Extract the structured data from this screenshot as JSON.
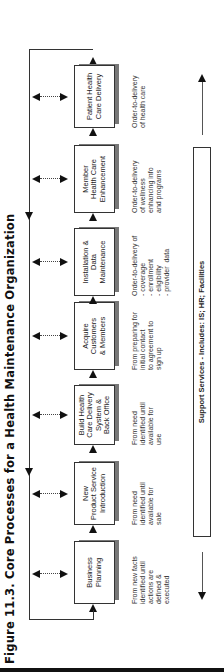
{
  "figure": {
    "title": "Figure 11.3.  Core Processes for a Health Maintenance Organization"
  },
  "processes": [
    {
      "name": "Business Planning",
      "lines": [
        "Business",
        "Planning"
      ],
      "description": "From new facts\nidentified until\nactions are\ndefined &\nexecuted"
    },
    {
      "name": "New Product Service Introduction",
      "lines": [
        "New",
        "Product Service",
        "Introduction"
      ],
      "description": "From need\nidentified until\navailable for\nsale"
    },
    {
      "name": "Build Health Care Delivery System & Back Office",
      "lines": [
        "Build Health",
        "Care Delivery",
        "System &",
        "Back Office"
      ],
      "description": "From need\nidentified until\navailable for\nuse"
    },
    {
      "name": "Acquire Customers & Members",
      "lines": [
        "Acquire",
        "Customers",
        "& Members"
      ],
      "description": "From preparing for\ninitial contact\nto agreement to\nsign up"
    },
    {
      "name": "Installation & Data Maintenance",
      "lines": [
        "Installation &",
        "Data",
        "Maintenance"
      ],
      "description": "Order-to-delivery of\n- coverage\n- enrollment\n- eligibility\n- provider  data"
    },
    {
      "name": "Member Health Care Enhancement",
      "lines": [
        "Member",
        "Health Care",
        "Enhancement"
      ],
      "description": "Order-to-delivery\nof wellness\nenhancing info\nand programs"
    },
    {
      "name": "Patient Health Care Delivery",
      "lines": [
        "Patient Health",
        "Care Delivery"
      ],
      "description": "Order-to-delivery\nof health care"
    }
  ],
  "support": {
    "label": "Support Services - Includes: IS; HR; Facilities"
  },
  "icons": {
    "flow_arrow": "arrow-right-icon",
    "bidirectional_arrow": "double-arrow-icon",
    "feedback_loop": "loop-arrow-icon"
  },
  "colors": {
    "line": "#333333",
    "shadow": "#777777",
    "background": "#ffffff"
  }
}
